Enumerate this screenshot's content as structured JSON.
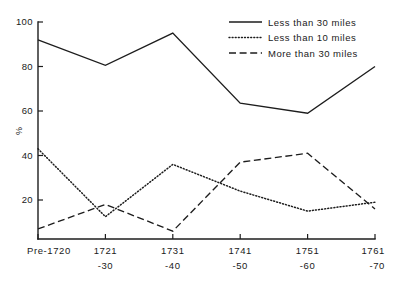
{
  "chart_data": {
    "type": "line",
    "title": "",
    "xlabel": "",
    "ylabel": "%",
    "ylim": [
      0,
      100
    ],
    "grid": false,
    "legend_position": "top-right",
    "categories": [
      "Pre-1720",
      "1721-30",
      "1731-40",
      "1741-50",
      "1751-60",
      "1761-70"
    ],
    "x_tick_labels": [
      {
        "line1": "Pre-1720",
        "line2": ""
      },
      {
        "line1": "1721",
        "line2": "-30"
      },
      {
        "line1": "1731",
        "line2": "-40"
      },
      {
        "line1": "1741",
        "line2": "-50"
      },
      {
        "line1": "1751",
        "line2": "-60"
      },
      {
        "line1": "1761",
        "line2": "-70"
      }
    ],
    "y_tick_labels": [
      "100",
      "80",
      "60",
      "40",
      "20"
    ],
    "y_tick_values": [
      100,
      80,
      60,
      40,
      20
    ],
    "series": [
      {
        "name": "Less than 30 miles",
        "style": "solid",
        "values": [
          92,
          80.5,
          95,
          63.5,
          59,
          80
        ]
      },
      {
        "name": "Less than 10 miles",
        "style": "dotted",
        "values": [
          43,
          12.5,
          36,
          24,
          15,
          19
        ]
      },
      {
        "name": "More than 30 miles",
        "style": "dashed",
        "values": [
          7,
          18,
          6,
          37,
          41,
          16
        ]
      }
    ],
    "colors": {
      "axis": "#1d1d1d",
      "ink": "#1a1a1a",
      "background": "#ffffff"
    }
  },
  "legend": {
    "items": [
      {
        "label": "Less than 30 miles",
        "style": "solid"
      },
      {
        "label": "Less than 10 miles",
        "style": "dotted"
      },
      {
        "label": "More than 30 miles",
        "style": "dashed"
      }
    ]
  }
}
